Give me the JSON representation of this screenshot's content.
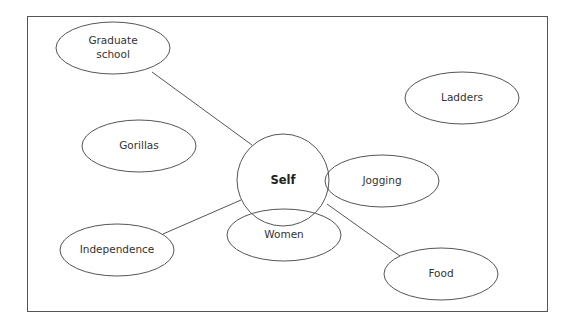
{
  "diagram": {
    "type": "concept-map",
    "center": {
      "label": "Self",
      "cx": 283,
      "cy": 180,
      "r": 46
    },
    "nodes": [
      {
        "id": "graduate-school",
        "lines": [
          "Graduate",
          "school"
        ],
        "cx": 113,
        "cy": 48,
        "rx": 57,
        "ry": 26,
        "connected": true
      },
      {
        "id": "gorillas",
        "lines": [
          "Gorillas"
        ],
        "cx": 139,
        "cy": 146,
        "rx": 57,
        "ry": 26,
        "connected": false
      },
      {
        "id": "ladders",
        "lines": [
          "Ladders"
        ],
        "cx": 462,
        "cy": 98,
        "rx": 57,
        "ry": 26,
        "connected": false
      },
      {
        "id": "jogging",
        "lines": [
          "Jogging"
        ],
        "cx": 382,
        "cy": 181,
        "rx": 57,
        "ry": 26,
        "connected": false,
        "overlaps_self": true
      },
      {
        "id": "women",
        "lines": [
          "Women"
        ],
        "cx": 284,
        "cy": 235,
        "rx": 57,
        "ry": 26,
        "connected": false,
        "overlaps_self": true
      },
      {
        "id": "independence",
        "lines": [
          "Independence"
        ],
        "cx": 117,
        "cy": 250,
        "rx": 57,
        "ry": 26,
        "connected": true
      },
      {
        "id": "food",
        "lines": [
          "Food"
        ],
        "cx": 441,
        "cy": 274,
        "rx": 57,
        "ry": 26,
        "connected": true
      }
    ],
    "edges": [
      {
        "from": "graduate-school",
        "to": "self",
        "x1": 152,
        "y1": 72,
        "x2": 252,
        "y2": 145
      },
      {
        "from": "independence",
        "to": "self",
        "x1": 163,
        "y1": 234,
        "x2": 241,
        "y2": 200
      },
      {
        "from": "food",
        "to": "self",
        "x1": 400,
        "y1": 256,
        "x2": 327,
        "y2": 204
      }
    ],
    "colors": {
      "stroke": "#555555",
      "text": "#333333",
      "background": "#ffffff"
    }
  }
}
